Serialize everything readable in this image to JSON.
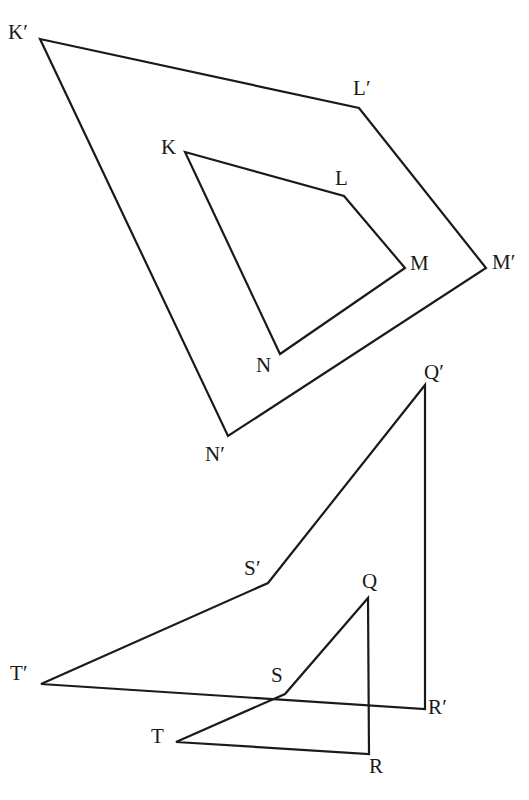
{
  "figure": {
    "canvas": {
      "width": 529,
      "height": 800
    },
    "background_color": "#ffffff",
    "stroke_color": "#1a1a1a",
    "stroke_width": 2.2
  },
  "shapes": [
    {
      "id": "outer-quadrilateral-klmn-prime",
      "name": "K'L'M'N'",
      "closed": true,
      "points": "40,39 359,108 486,268 228,436"
    },
    {
      "id": "inner-quadrilateral-klmn",
      "name": "KLMN",
      "closed": true,
      "points": "185,152 344,196 405,268 280,354"
    },
    {
      "id": "outer-triangle-qrst-prime",
      "name": "Q'R'S'T'",
      "closed": true,
      "points": "425,385 425,709 41,684 268,583"
    },
    {
      "id": "inner-triangle-qrst",
      "name": "QRST",
      "closed": true,
      "points": "368,598 369,754 176,742 285,694"
    }
  ],
  "labels": [
    {
      "id": "label-k-prime",
      "text": "K′",
      "x": 8,
      "y": 22
    },
    {
      "id": "label-l-prime",
      "text": "L′",
      "x": 353,
      "y": 78
    },
    {
      "id": "label-m-prime",
      "text": "M′",
      "x": 492,
      "y": 252
    },
    {
      "id": "label-n-prime",
      "text": "N′",
      "x": 205,
      "y": 444
    },
    {
      "id": "label-k",
      "text": "K",
      "x": 161,
      "y": 137
    },
    {
      "id": "label-l",
      "text": "L",
      "x": 335,
      "y": 168
    },
    {
      "id": "label-m",
      "text": "M",
      "x": 410,
      "y": 253
    },
    {
      "id": "label-n",
      "text": "N",
      "x": 256,
      "y": 355
    },
    {
      "id": "label-q-prime",
      "text": "Q′",
      "x": 424,
      "y": 362
    },
    {
      "id": "label-s-prime",
      "text": "S′",
      "x": 244,
      "y": 558
    },
    {
      "id": "label-q",
      "text": "Q",
      "x": 362,
      "y": 571
    },
    {
      "id": "label-t-prime",
      "text": "T′",
      "x": 10,
      "y": 663
    },
    {
      "id": "label-s",
      "text": "S",
      "x": 271,
      "y": 665
    },
    {
      "id": "label-r-prime",
      "text": "R′",
      "x": 428,
      "y": 697
    },
    {
      "id": "label-t",
      "text": "T",
      "x": 151,
      "y": 726
    },
    {
      "id": "label-r",
      "text": "R",
      "x": 369,
      "y": 756
    }
  ]
}
